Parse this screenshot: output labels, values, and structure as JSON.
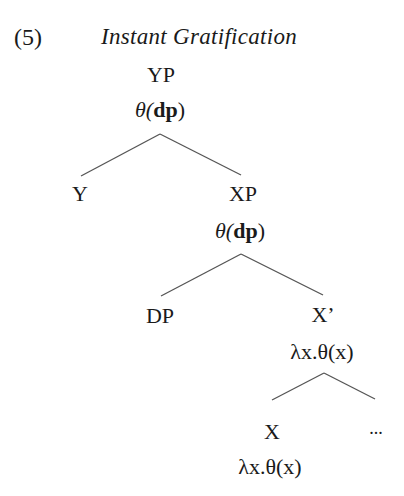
{
  "example": {
    "number": "(5)",
    "title": "Instant Gratification"
  },
  "tree": {
    "root": {
      "label": "YP",
      "semantics": {
        "pre": "θ(",
        "bold": "dp",
        "post": ")"
      }
    },
    "y": {
      "label": "Y"
    },
    "xp": {
      "label": "XP",
      "semantics": {
        "pre": "θ(",
        "bold": "dp",
        "post": ")"
      }
    },
    "dp": {
      "label": "DP"
    },
    "xbar": {
      "label": "X’",
      "semantics": "λx.θ(x)"
    },
    "x": {
      "label": "X",
      "semantics": "λx.θ(x)"
    },
    "complement": {
      "label": "..."
    }
  },
  "colors": {
    "text": "#1a1a1a",
    "edge": "#555555",
    "background": "#ffffff"
  }
}
